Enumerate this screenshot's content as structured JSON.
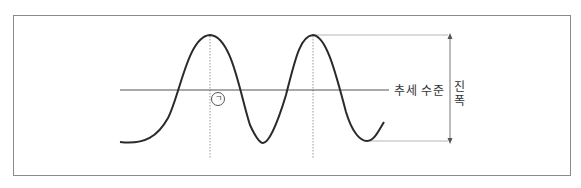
{
  "diagram": {
    "type": "cycle-wave",
    "trend_label": "추세 수준",
    "amplitude_label_chars": [
      "진",
      "폭"
    ],
    "amplitude_label": "진폭",
    "marker_label": "ㄱ",
    "colors": {
      "wave": "#2a2a2a",
      "trend_line": "#555555",
      "guides": "#999999",
      "frame": "#8a8a8a"
    }
  }
}
